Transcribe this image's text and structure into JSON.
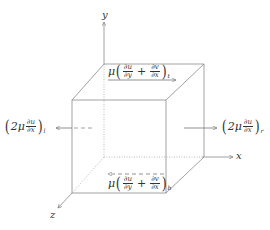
{
  "axes": {
    "x_label": "x",
    "y_label": "y",
    "z_label": "z"
  },
  "forces": {
    "top": {
      "coef": "μ",
      "frac1_num": "∂u",
      "frac1_den": "∂y",
      "operator": "+",
      "frac2_num": "∂v",
      "frac2_den": "∂x",
      "subscript": "t"
    },
    "bottom": {
      "coef": "μ",
      "frac1_num": "∂u",
      "frac1_den": "∂y",
      "operator": "+",
      "frac2_num": "∂v",
      "frac2_den": "∂x",
      "subscript": "b"
    },
    "left": {
      "coef": "2μ",
      "frac_num": "∂u",
      "frac_den": "∂x",
      "subscript": "l"
    },
    "right": {
      "coef": "2μ",
      "frac_num": "∂u",
      "frac_den": "∂x",
      "subscript": "r"
    }
  },
  "colors": {
    "line": "#8a8a8a",
    "text": "#333333"
  }
}
